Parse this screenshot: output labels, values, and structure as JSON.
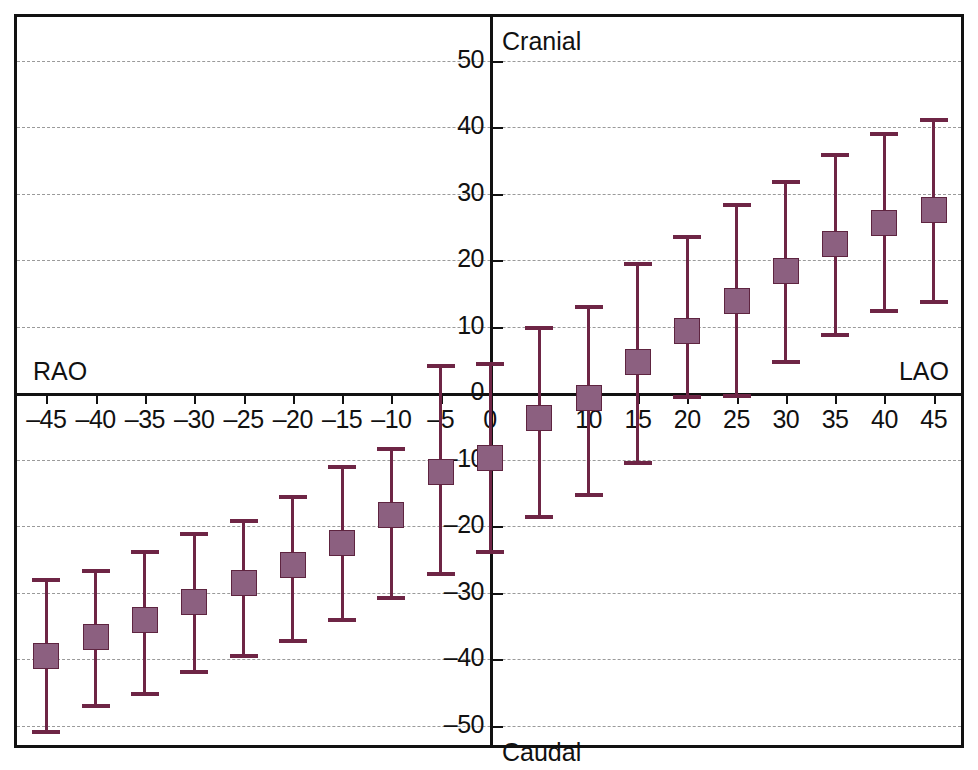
{
  "chart_data": {
    "type": "scatter",
    "title": "",
    "xlabel": "",
    "ylabel": "",
    "xlim": [
      -50,
      50
    ],
    "ylim": [
      -55,
      55
    ],
    "grid": true,
    "legend_position": "none",
    "x_ticks": [
      -45,
      -40,
      -35,
      -30,
      -25,
      -20,
      -15,
      -10,
      -5,
      0,
      5,
      10,
      15,
      20,
      25,
      30,
      35,
      40,
      45
    ],
    "x_tick_labels": [
      "–45",
      "–40",
      "–35",
      "–30",
      "–25",
      "–20",
      "–15",
      "–10",
      "–5",
      "0",
      "5",
      "10",
      "15",
      "20",
      "25",
      "30",
      "35",
      "40",
      "45"
    ],
    "y_ticks": [
      50,
      40,
      30,
      20,
      10,
      0,
      -10,
      -20,
      -30,
      -40,
      -50
    ],
    "y_tick_labels": [
      "50",
      "40",
      "30",
      "20",
      "10",
      "0",
      "–10",
      "–20",
      "–30",
      "–40",
      "–50"
    ],
    "quadrant_labels": {
      "top_left": "RAO",
      "top_right": "Cranial",
      "right": "LAO",
      "bottom_right": "Caudal"
    },
    "series": [
      {
        "name": "angulation",
        "marker": "filled-square",
        "color": "#8C6080",
        "error_color": "#6E2545",
        "points": [
          {
            "x": -45,
            "y": -39.5,
            "low": -50.7,
            "high": -27.8
          },
          {
            "x": -40,
            "y": -36.7,
            "low": -46.8,
            "high": -26.4
          },
          {
            "x": -35,
            "y": -34.2,
            "low": -44.9,
            "high": -23.6
          },
          {
            "x": -30,
            "y": -31.4,
            "low": -41.6,
            "high": -20.9
          },
          {
            "x": -25,
            "y": -28.6,
            "low": -39.3,
            "high": -19.0
          },
          {
            "x": -20,
            "y": -25.8,
            "low": -37.0,
            "high": -15.3
          },
          {
            "x": -15,
            "y": -22.5,
            "low": -33.8,
            "high": -10.9
          },
          {
            "x": -10,
            "y": -18.4,
            "low": -30.6,
            "high": -8.1
          },
          {
            "x": -5,
            "y": -11.9,
            "low": -26.9,
            "high": 4.3
          },
          {
            "x": 0,
            "y": -9.7,
            "low": -23.6,
            "high": 4.7
          },
          {
            "x": 5,
            "y": -3.8,
            "low": -18.4,
            "high": 10.1
          },
          {
            "x": 10,
            "y": -0.7,
            "low": -15.1,
            "high": 13.3
          },
          {
            "x": 15,
            "y": 4.6,
            "low": -10.2,
            "high": 19.7
          },
          {
            "x": 20,
            "y": 9.3,
            "low": -0.3,
            "high": 23.8
          },
          {
            "x": 25,
            "y": 13.9,
            "low": -0.1,
            "high": 28.5
          },
          {
            "x": 30,
            "y": 18.4,
            "low": 4.9,
            "high": 32.1
          },
          {
            "x": 35,
            "y": 22.4,
            "low": 9.0,
            "high": 36.1
          },
          {
            "x": 40,
            "y": 25.6,
            "low": 12.6,
            "high": 39.3
          },
          {
            "x": 45,
            "y": 27.5,
            "low": 14.0,
            "high": 41.3
          }
        ]
      }
    ]
  }
}
